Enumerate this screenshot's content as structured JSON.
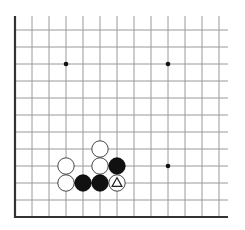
{
  "board": {
    "type": "go-corner-diagram",
    "visible_columns": 13,
    "visible_rows": 12,
    "edges": [
      "left",
      "bottom"
    ],
    "origin_x": 15,
    "origin_y": 217,
    "spacing": 17.0,
    "line_color": "#9a9a9a",
    "edge_color": "#333333",
    "star_points": [
      {
        "col": 3,
        "row": 9
      },
      {
        "col": 9,
        "row": 9
      },
      {
        "col": 9,
        "row": 3
      }
    ],
    "stones": [
      {
        "col": 5,
        "row": 4,
        "color": "white"
      },
      {
        "col": 3,
        "row": 3,
        "color": "white"
      },
      {
        "col": 5,
        "row": 3,
        "color": "white"
      },
      {
        "col": 6,
        "row": 3,
        "color": "black"
      },
      {
        "col": 3,
        "row": 2,
        "color": "white"
      },
      {
        "col": 4,
        "row": 2,
        "color": "black"
      },
      {
        "col": 5,
        "row": 2,
        "color": "black"
      },
      {
        "col": 6,
        "row": 2,
        "color": "white",
        "marker": "triangle"
      }
    ]
  }
}
